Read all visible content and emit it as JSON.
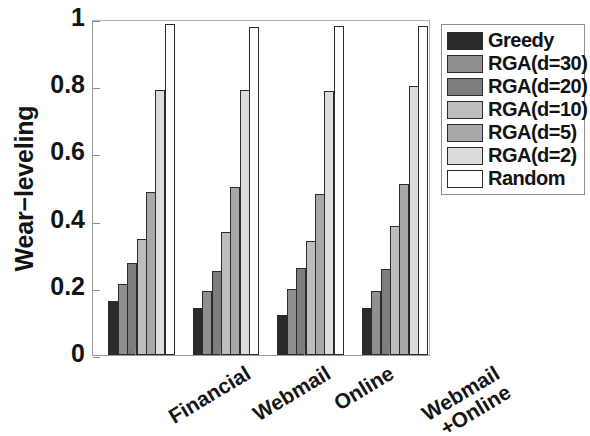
{
  "chart_data": {
    "type": "bar",
    "title": "",
    "xlabel": "",
    "ylabel": "Wear−leveling",
    "ylim": [
      0,
      1
    ],
    "yticks": [
      0,
      0.2,
      0.4,
      0.6,
      0.8,
      1
    ],
    "ytick_labels": [
      "0",
      "0.2",
      "0.4",
      "0.6",
      "0.8",
      "1"
    ],
    "grid": false,
    "legend_position": "upper right",
    "categories": [
      "Financial",
      "Webmail",
      "Online",
      "Webmail\n+Online"
    ],
    "category_labels": [
      {
        "line1": "Financial",
        "line2": ""
      },
      {
        "line1": "Webmail",
        "line2": ""
      },
      {
        "line1": "Online",
        "line2": ""
      },
      {
        "line1": "Webmail",
        "line2": "+Online"
      }
    ],
    "series": [
      {
        "name": "Greedy",
        "color": "#2b2b2b",
        "values": [
          0.16,
          0.14,
          0.12,
          0.14
        ]
      },
      {
        "name": "RGA(d=30)",
        "color": "#8f8f8f",
        "values": [
          0.21,
          0.19,
          0.195,
          0.19
        ]
      },
      {
        "name": "RGA(d=20)",
        "color": "#7d7d7d",
        "values": [
          0.275,
          0.25,
          0.26,
          0.255
        ]
      },
      {
        "name": "RGA(d=10)",
        "color": "#bdbdbd",
        "values": [
          0.345,
          0.365,
          0.34,
          0.385
        ]
      },
      {
        "name": "RGA(d=5)",
        "color": "#a8a8a8",
        "values": [
          0.485,
          0.5,
          0.48,
          0.51
        ]
      },
      {
        "name": "RGA(d=2)",
        "color": "#dcdcdc",
        "values": [
          0.79,
          0.79,
          0.785,
          0.8
        ]
      },
      {
        "name": "Random",
        "color": "#ffffff",
        "values": [
          0.985,
          0.975,
          0.98,
          0.98
        ]
      }
    ]
  },
  "legend": {
    "items": [
      {
        "label": "Greedy"
      },
      {
        "label": "RGA(d=30)"
      },
      {
        "label": "RGA(d=20)"
      },
      {
        "label": "RGA(d=10)"
      },
      {
        "label": "RGA(d=5)"
      },
      {
        "label": "RGA(d=2)"
      },
      {
        "label": "Random"
      }
    ]
  },
  "axis": {
    "y_title": "Wear−leveling"
  },
  "colors": {
    "axis_line": "#9a9a9a",
    "bar_edge": "#2b2b2b",
    "text": "#141414",
    "background": "#ffffff"
  }
}
